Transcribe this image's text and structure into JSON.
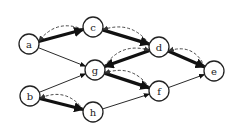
{
  "diagram": {
    "type": "directed-graph",
    "colors": {
      "node_stroke": "#222222",
      "node_fill": "#ffffff",
      "edge": "#111111",
      "background": "#ffffff"
    },
    "nodes": [
      {
        "id": "a",
        "label": "a",
        "x": 29,
        "y": 44
      },
      {
        "id": "c",
        "label": "c",
        "x": 93,
        "y": 27
      },
      {
        "id": "d",
        "label": "d",
        "x": 159,
        "y": 47
      },
      {
        "id": "e",
        "label": "e",
        "x": 214,
        "y": 71
      },
      {
        "id": "g",
        "label": "g",
        "x": 95,
        "y": 70
      },
      {
        "id": "f",
        "label": "f",
        "x": 159,
        "y": 91
      },
      {
        "id": "b",
        "label": "b",
        "x": 30,
        "y": 96
      },
      {
        "id": "h",
        "label": "h",
        "x": 93,
        "y": 112
      }
    ],
    "edges": [
      {
        "from": "a",
        "to": "c",
        "style": "thick"
      },
      {
        "from": "c",
        "to": "d",
        "style": "thick"
      },
      {
        "from": "d",
        "to": "g",
        "style": "thick"
      },
      {
        "from": "d",
        "to": "e",
        "style": "thick"
      },
      {
        "from": "g",
        "to": "f",
        "style": "thick"
      },
      {
        "from": "b",
        "to": "h",
        "style": "thick"
      },
      {
        "from": "a",
        "to": "g",
        "style": "thin"
      },
      {
        "from": "b",
        "to": "g",
        "style": "thin"
      },
      {
        "from": "h",
        "to": "f",
        "style": "thin"
      },
      {
        "from": "f",
        "to": "e",
        "style": "thin"
      },
      {
        "from": "c",
        "to": "a",
        "style": "dashed"
      },
      {
        "from": "d",
        "to": "c",
        "style": "dashed"
      },
      {
        "from": "e",
        "to": "d",
        "style": "dashed"
      },
      {
        "from": "g",
        "to": "d",
        "style": "dashed"
      },
      {
        "from": "f",
        "to": "g",
        "style": "dashed"
      },
      {
        "from": "h",
        "to": "b",
        "style": "dashed"
      }
    ]
  }
}
